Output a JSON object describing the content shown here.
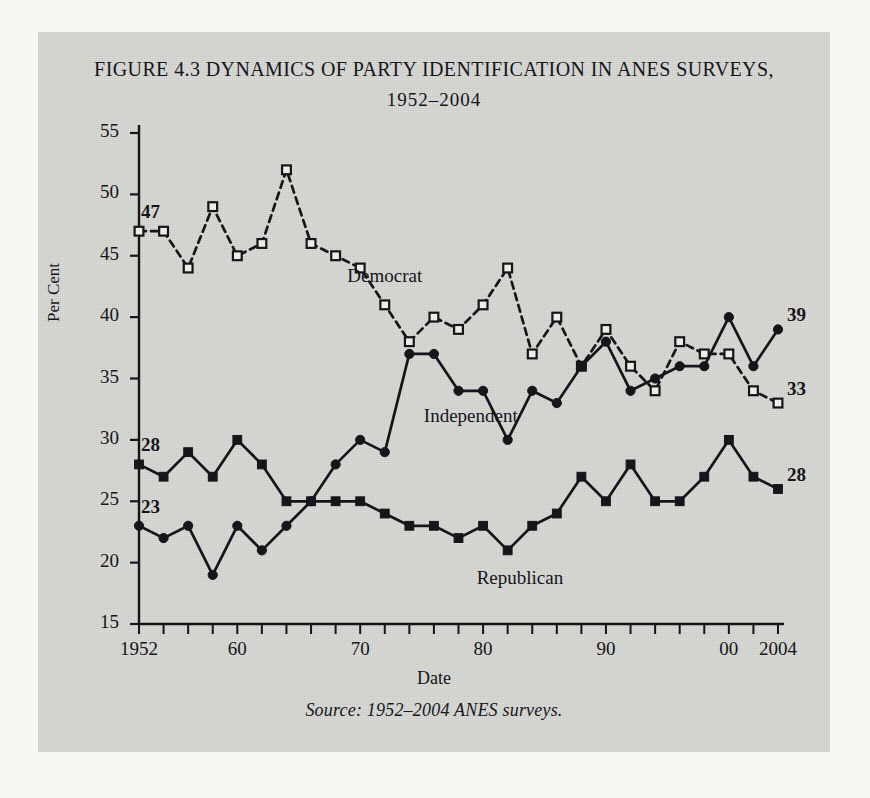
{
  "figure": {
    "title_line1": "FIGURE 4.3 DYNAMICS OF PARTY IDENTIFICATION IN ANES SURVEYS,",
    "title_line2": "1952–2004",
    "source": "Source: 1952–2004 ANES surveys.",
    "panel_bg": "#d2d2ce",
    "page_bg": "#f7f7f5",
    "ink": "#15151a"
  },
  "chart_data": {
    "type": "line",
    "title": "FIGURE 4.3 DYNAMICS OF PARTY IDENTIFICATION IN ANES SURVEYS, 1952–2004",
    "xlabel": "Date",
    "ylabel": "Per Cent",
    "xlim": [
      1952,
      2004
    ],
    "ylim": [
      15,
      55
    ],
    "ytick_values": [
      15,
      20,
      25,
      30,
      35,
      40,
      45,
      50,
      55
    ],
    "ytick_labels": [
      "15",
      "20",
      "25",
      "30",
      "35",
      "40",
      "45",
      "50",
      "55"
    ],
    "xtick_values": [
      1952,
      1954,
      1956,
      1958,
      1960,
      1962,
      1964,
      1966,
      1968,
      1970,
      1972,
      1974,
      1976,
      1978,
      1980,
      1982,
      1984,
      1986,
      1988,
      1990,
      1992,
      1994,
      1996,
      1998,
      2000,
      2002,
      2004
    ],
    "xtick_labeled": [
      {
        "value": 1952,
        "label": "1952"
      },
      {
        "value": 1960,
        "label": "60"
      },
      {
        "value": 1970,
        "label": "70"
      },
      {
        "value": 1980,
        "label": "80"
      },
      {
        "value": 1990,
        "label": "90"
      },
      {
        "value": 2000,
        "label": "00"
      },
      {
        "value": 2004,
        "label": "2004"
      }
    ],
    "grid": false,
    "legend": "inline-annotations",
    "x": [
      1952,
      1954,
      1956,
      1958,
      1960,
      1962,
      1964,
      1966,
      1968,
      1970,
      1972,
      1974,
      1976,
      1978,
      1980,
      1982,
      1984,
      1986,
      1988,
      1990,
      1992,
      1994,
      1996,
      1998,
      2000,
      2002,
      2004
    ],
    "series": [
      {
        "name": "Democrat",
        "marker": "open-square",
        "line_style": "dashed",
        "color": "#15151a",
        "values": [
          47,
          47,
          44,
          49,
          45,
          46,
          52,
          46,
          45,
          44,
          41,
          38,
          40,
          39,
          41,
          44,
          37,
          40,
          36,
          39,
          36,
          34,
          38,
          37,
          37,
          34,
          33
        ],
        "start_label": "47",
        "end_label": "33"
      },
      {
        "name": "Independent",
        "marker": "filled-circle",
        "line_style": "solid",
        "color": "#15151a",
        "values": [
          23,
          22,
          23,
          19,
          23,
          21,
          23,
          25,
          28,
          30,
          29,
          37,
          37,
          34,
          34,
          30,
          34,
          33,
          36,
          38,
          34,
          35,
          36,
          36,
          40,
          36,
          39
        ],
        "start_label": "23",
        "end_label": "39"
      },
      {
        "name": "Republican",
        "marker": "filled-square",
        "line_style": "solid",
        "color": "#15151a",
        "values": [
          28,
          27,
          29,
          27,
          30,
          28,
          25,
          25,
          25,
          25,
          24,
          23,
          23,
          22,
          23,
          21,
          23,
          24,
          27,
          25,
          28,
          25,
          25,
          27,
          30,
          27,
          26
        ],
        "start_label": "28",
        "end_label": "28"
      }
    ],
    "annotations": [
      {
        "text": "Democrat",
        "x": 1972,
        "y": 43.2
      },
      {
        "text": "Independent",
        "x": 1979,
        "y": 31.8
      },
      {
        "text": "Republican",
        "x": 1983,
        "y": 18.6
      }
    ]
  }
}
